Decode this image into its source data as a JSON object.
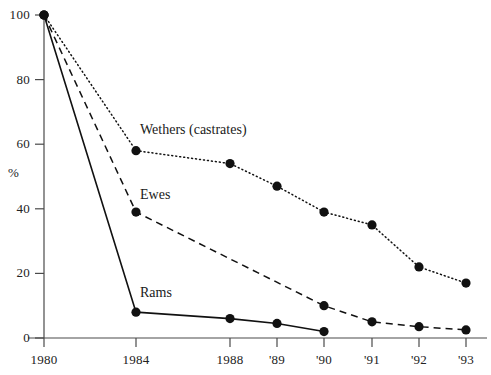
{
  "chart_data": {
    "type": "line",
    "title": "",
    "subtitle": "",
    "xlabel": "",
    "ylabel": "%",
    "ylim": [
      0,
      100
    ],
    "yticks": [
      0,
      20,
      40,
      60,
      80,
      100
    ],
    "ytick_labels": [
      "0",
      "20",
      "40",
      "60",
      "80",
      "100"
    ],
    "categories": [
      "1980",
      "1984",
      "1988",
      "'89",
      "'90",
      "'91",
      "'92",
      "'93"
    ],
    "x_positions_px": [
      44,
      136,
      230,
      277,
      324,
      372,
      419,
      466
    ],
    "grid": false,
    "legend": "inline-annotations",
    "series": [
      {
        "name": "Wethers (castrates)",
        "label": "Wethers (castrates)",
        "line_style": "dotted",
        "color": "#111111",
        "marker": "filled-circle",
        "x": [
          "1980",
          "1984",
          "1988",
          "'89",
          "'90",
          "'91",
          "'92",
          "'93"
        ],
        "values": [
          100,
          58,
          54,
          47,
          39,
          35,
          22,
          17
        ]
      },
      {
        "name": "Ewes",
        "label": "Ewes",
        "line_style": "dashed",
        "color": "#111111",
        "marker": "filled-circle",
        "x": [
          "1980",
          "1984",
          "'90",
          "'91",
          "'92",
          "'93"
        ],
        "values": [
          100,
          39,
          10,
          5,
          3.5,
          2.5
        ]
      },
      {
        "name": "Rams",
        "label": "Rams",
        "line_style": "solid",
        "color": "#111111",
        "marker": "filled-circle",
        "x": [
          "1980",
          "1984",
          "1988",
          "'89",
          "'90"
        ],
        "values": [
          100,
          8,
          6,
          4.5,
          2
        ]
      }
    ],
    "annotations": [
      {
        "text": "Wethers (castrates)",
        "x_px": 140,
        "y_px": 130
      },
      {
        "text": "Ewes",
        "x_px": 140,
        "y_px": 195
      },
      {
        "text": "Rams",
        "x_px": 140,
        "y_px": 293
      }
    ]
  },
  "axes": {
    "y_label": "%",
    "y_tick_labels": [
      "100",
      "80",
      "60",
      "40",
      "20",
      "0"
    ],
    "x_tick_labels": [
      "1980",
      "1984",
      "1988",
      "'89",
      "'90",
      "'91",
      "'92",
      "'93"
    ]
  }
}
